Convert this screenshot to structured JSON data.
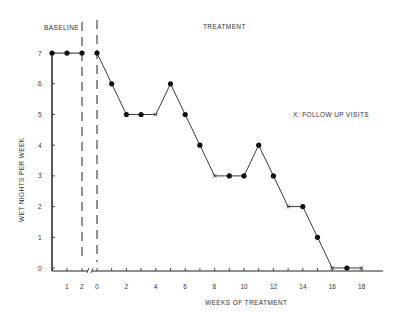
{
  "chart_data": {
    "type": "line",
    "title": "",
    "xlabel": "WEEKS OF TREATMENT",
    "ylabel": "WET NIGHTS PER WEEK",
    "ylim": [
      0,
      7
    ],
    "yticks": [
      "0",
      "1",
      "2",
      "3",
      "4",
      "5",
      "6",
      "7"
    ],
    "phases": [
      {
        "name": "BASELINE",
        "label": "BASELINE"
      },
      {
        "name": "TREATMENT",
        "label": "TREATMENT"
      }
    ],
    "legend_note": "X:  FOLLOW UP VISITS",
    "grid": false,
    "baseline": {
      "x_ticks": [
        "1",
        "2"
      ],
      "points": [
        {
          "week": 0,
          "value": 7,
          "marker": "dot"
        },
        {
          "week": 1,
          "value": 7,
          "marker": "dot"
        },
        {
          "week": 2,
          "value": 7,
          "marker": "dot"
        }
      ]
    },
    "treatment": {
      "x_ticks": [
        "0",
        "2",
        "4",
        "6",
        "8",
        "10",
        "12",
        "14",
        "16",
        "18"
      ],
      "points": [
        {
          "week": 0,
          "value": 7,
          "marker": "dot"
        },
        {
          "week": 1,
          "value": 6,
          "marker": "dot"
        },
        {
          "week": 2,
          "value": 5,
          "marker": "dot"
        },
        {
          "week": 3,
          "value": 5,
          "marker": "dot"
        },
        {
          "week": 4,
          "value": 5,
          "marker": "x"
        },
        {
          "week": 5,
          "value": 6,
          "marker": "dot"
        },
        {
          "week": 6,
          "value": 5,
          "marker": "dot"
        },
        {
          "week": 7,
          "value": 4,
          "marker": "dot"
        },
        {
          "week": 8,
          "value": 3,
          "marker": "x"
        },
        {
          "week": 9,
          "value": 3,
          "marker": "dot"
        },
        {
          "week": 10,
          "value": 3,
          "marker": "dot"
        },
        {
          "week": 11,
          "value": 4,
          "marker": "dot"
        },
        {
          "week": 12,
          "value": 3,
          "marker": "dot"
        },
        {
          "week": 13,
          "value": 2,
          "marker": "x"
        },
        {
          "week": 14,
          "value": 2,
          "marker": "dot"
        },
        {
          "week": 15,
          "value": 1,
          "marker": "dot"
        },
        {
          "week": 16,
          "value": 0,
          "marker": "x"
        },
        {
          "week": 17,
          "value": 0,
          "marker": "dot"
        },
        {
          "week": 18,
          "value": 0,
          "marker": "x"
        }
      ]
    }
  },
  "labels": {
    "baseline": "BASELINE",
    "treatment": "TREATMENT",
    "legend": "X:  FOLLOW UP VISITS",
    "xlabel": "WEEKS  OF  TREATMENT",
    "ylabel": "WET NIGHTS PER WEEK"
  }
}
